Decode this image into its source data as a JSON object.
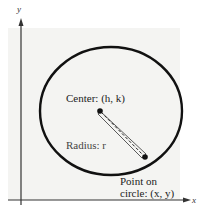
{
  "diagram": {
    "axes": {
      "x_label": "x",
      "y_label": "y"
    },
    "labels": {
      "center": "Center: (h, k)",
      "radius": "Radius: r",
      "point_line1": "Point on",
      "point_line2": "circle: (x, y)"
    },
    "colors": {
      "stroke": "#111111",
      "background": "#f4f4f2"
    }
  }
}
